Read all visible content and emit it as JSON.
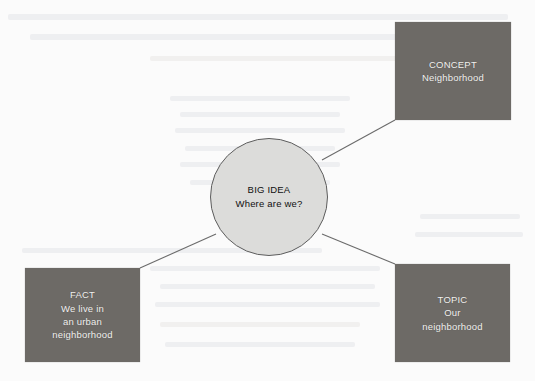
{
  "diagram": {
    "type": "concept-web",
    "background_color": "#fbfbfb",
    "node_fill_color": "#6d6a66",
    "node_text_color": "#f2f1ef",
    "center_fill_color": "#dcdcda",
    "center_border_color": "#5d5d5d",
    "connector_color": "#6b6b6b",
    "center": {
      "label": "BIG IDEA",
      "text": "Where are we?"
    },
    "nodes": [
      {
        "id": "concept",
        "label": "CONCEPT",
        "text": "Neighborhood",
        "position": "top-right"
      },
      {
        "id": "fact",
        "label": "FACT",
        "line1": "We live in",
        "line2": "an urban",
        "line3": "neighborhood",
        "position": "bottom-left"
      },
      {
        "id": "topic",
        "label": "TOPIC",
        "line1": "Our",
        "line2": "neighborhood",
        "position": "bottom-right"
      }
    ]
  }
}
